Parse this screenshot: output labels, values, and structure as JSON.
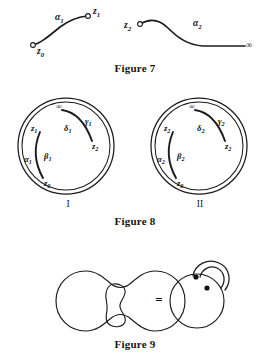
{
  "page": {
    "kind": "mathematical-figure-plate",
    "background": "#ffffff",
    "ink": "#1b1b1b"
  },
  "figure7": {
    "caption": "Figure 7",
    "caption_pos": {
      "x": 135,
      "y": 69
    },
    "curves": [
      {
        "name": "alpha-1-path",
        "label": "α",
        "label_sub": "1",
        "label_pos": {
          "x": 55,
          "y": 18
        },
        "path": "M 33 45 C 41 43 49 36 60 27 C 68 21 78 17 87 16",
        "endpoints": [
          {
            "name": "z0",
            "label": "z",
            "sub": "0",
            "marker": {
              "x": 33,
              "y": 45
            },
            "label_pos": {
              "x": 41,
              "y": 52
            }
          },
          {
            "name": "z1",
            "label": "z",
            "sub": "1",
            "marker": {
              "x": 88,
              "y": 16
            },
            "label_pos": {
              "x": 96,
              "y": 12
            }
          }
        ]
      },
      {
        "name": "alpha-2-path",
        "label": "α",
        "label_sub": "2",
        "label_pos": {
          "x": 196,
          "y": 24
        },
        "path": "M 140 24 C 150 18 159 19 168 28 C 178 38 188 45 203 46 C 215 46 230 46 245 46",
        "endpoints": [
          {
            "name": "z2",
            "label": "z",
            "sub": "2",
            "marker": {
              "x": 140,
              "y": 24
            },
            "label_pos": {
              "x": 128,
              "y": 27
            }
          },
          {
            "name": "infinity",
            "label": "∞",
            "marker": null,
            "label_pos": {
              "x": 251,
              "y": 46
            }
          }
        ]
      }
    ]
  },
  "figure8": {
    "caption": "Figure 8",
    "caption_pos": {
      "x": 135,
      "y": 222
    },
    "disks": [
      {
        "name": "disk-I",
        "roman": "I",
        "roman_pos": {
          "x": 68,
          "y": 205
        },
        "center": {
          "x": 66,
          "y": 146
        },
        "radius_outer": 48,
        "radius_inner": 44,
        "boundary_points": [
          {
            "name": "infinity-top",
            "label": "∞",
            "pos": {
              "x": 61,
              "y": 107
            }
          },
          {
            "name": "z1-left",
            "label": "z",
            "sub": "1",
            "pos": {
              "x": 35,
              "y": 129
            }
          },
          {
            "name": "z2-right",
            "label": "z",
            "sub": "2",
            "pos": {
              "x": 96,
              "y": 147
            }
          },
          {
            "name": "z0-bottom",
            "label": "z",
            "sub": "0",
            "pos": {
              "x": 48,
              "y": 184
            }
          }
        ],
        "arcs": [
          {
            "name": "delta-gamma-arc",
            "path": "M 62 110 C 76 112 86 124 92 141",
            "labels": [
              {
                "name": "delta-1",
                "label": "δ",
                "sub": "1",
                "pos": {
                  "x": 68,
                  "y": 129
                }
              },
              {
                "name": "gamma-1",
                "label": "γ",
                "sub": "1",
                "pos": {
                  "x": 88,
                  "y": 122
                }
              }
            ]
          },
          {
            "name": "alpha-beta-arc",
            "path": "M 40 132 C 34 146 34 162 43 178",
            "labels": [
              {
                "name": "alpha-1",
                "label": "α",
                "sub": "1",
                "pos": {
                  "x": 28,
                  "y": 160
                }
              },
              {
                "name": "beta-1",
                "label": "β",
                "sub": "1",
                "pos": {
                  "x": 47,
                  "y": 157
                }
              }
            ]
          }
        ]
      },
      {
        "name": "disk-II",
        "roman": "II",
        "roman_pos": {
          "x": 200,
          "y": 205
        },
        "center": {
          "x": 199,
          "y": 146
        },
        "radius_outer": 48,
        "radius_inner": 44,
        "boundary_points": [
          {
            "name": "infinity-top",
            "label": "∞",
            "pos": {
              "x": 194,
              "y": 107
            }
          },
          {
            "name": "z2-left",
            "label": "z",
            "sub": "2",
            "pos": {
              "x": 168,
              "y": 129
            }
          },
          {
            "name": "z2-right",
            "label": "z",
            "sub": "2",
            "pos": {
              "x": 229,
              "y": 147
            }
          },
          {
            "name": "z0-bottom",
            "label": "z",
            "sub": "0",
            "pos": {
              "x": 181,
              "y": 184
            }
          }
        ],
        "arcs": [
          {
            "name": "delta-gamma-arc",
            "path": "M 195 110 C 209 112 219 124 225 141",
            "labels": [
              {
                "name": "delta-2",
                "label": "δ",
                "sub": "2",
                "pos": {
                  "x": 201,
                  "y": 129
                }
              },
              {
                "name": "gamma-2",
                "label": "γ",
                "sub": "2",
                "pos": {
                  "x": 221,
                  "y": 122
                }
              }
            ]
          },
          {
            "name": "alpha-beta-arc",
            "path": "M 173 132 C 167 146 167 162 176 178",
            "labels": [
              {
                "name": "alpha-2",
                "label": "α",
                "sub": "2",
                "pos": {
                  "x": 161,
                  "y": 160
                }
              },
              {
                "name": "beta-2",
                "label": "β",
                "sub": "2",
                "pos": {
                  "x": 180,
                  "y": 157
                }
              }
            ]
          }
        ]
      }
    ]
  },
  "figure9": {
    "caption": "Figure 9",
    "caption_pos": {
      "x": 135,
      "y": 345
    },
    "equals_sign": "=",
    "equals_pos": {
      "x": 159,
      "y": 300
    },
    "left_shape": {
      "name": "genus-two-surface",
      "outline": "M 86 271 C 96 271 103 277 110 283 C 117 289 124 289 131 283 C 138 277 145 271 155 271 C 172 271 185 284 185 301 C 185 318 172 331 155 331 C 145 331 138 325 131 319 C 124 313 117 313 110 319 C 103 325 96 331 86 331 C 69 331 56 318 56 301 C 56 284 69 271 86 271 Z",
      "hole": "M 113 284 C 120 283 126 287 125 293 C 124 299 119 302 120 307 C 121 313 127 316 125 322 C 123 327 115 328 110 325 C 105 322 106 316 107 310 C 108 304 105 299 106 293 C 107 287 109 285 113 284 Z"
    },
    "right_shape": {
      "name": "torus-with-handle",
      "circle": {
        "cx": 197,
        "cy": 301,
        "r": 27
      },
      "handle_outer": "M 193 276 C 195 264 208 258 219 263 C 230 268 232 281 225 290",
      "handle_inner": "M 200 277 C 202 269 210 265 217 268 C 225 272 226 281 221 288",
      "dots": [
        {
          "name": "branch-point-1",
          "cx": 196,
          "cy": 277,
          "r": 2.6
        },
        {
          "name": "branch-point-2",
          "cx": 207,
          "cy": 288,
          "r": 2.6
        }
      ]
    }
  }
}
